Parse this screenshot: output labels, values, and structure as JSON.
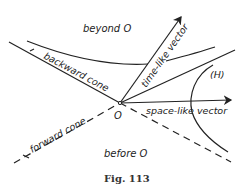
{
  "labels": {
    "beyond": "beyond O",
    "before": "before O",
    "origin": "O",
    "backward_cone": "backward cone",
    "forward_cone": "forward cone",
    "time_like": "time-like vector",
    "space_like": "space-like vector",
    "hyperbola": "(H)"
  },
  "caption": "Fig. 113",
  "colors": {
    "ink": "#222222"
  }
}
